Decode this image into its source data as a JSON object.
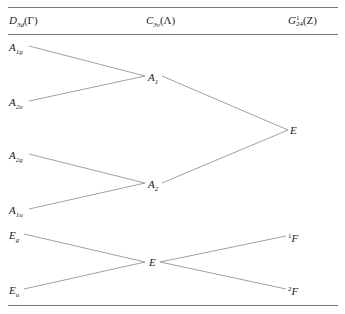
{
  "header": {
    "col1": {
      "main": "D",
      "sub": "3d",
      "paren": "(Γ)"
    },
    "col2": {
      "main": "C",
      "sub": "3v",
      "paren": "(Λ)"
    },
    "col3": {
      "main": "G",
      "sup": "1",
      "sub": "24",
      "paren": "(Z)"
    }
  },
  "left_states": [
    {
      "main": "A",
      "sub": "1g"
    },
    {
      "main": "A",
      "sub": "2u"
    },
    {
      "main": "A",
      "sub": "2g"
    },
    {
      "main": "A",
      "sub": "1u"
    },
    {
      "main": "E",
      "sub": "g"
    },
    {
      "main": "E",
      "sub": "u"
    }
  ],
  "middle_states": [
    {
      "main": "A",
      "sub": "1"
    },
    {
      "main": "A",
      "sub": "2"
    },
    {
      "main": "E",
      "sub": ""
    }
  ],
  "right_states": [
    {
      "main": "E",
      "sup": ""
    },
    {
      "main": "F",
      "sup": "1"
    },
    {
      "main": "F",
      "sup": "2"
    }
  ],
  "correlations": [
    {
      "from": "A1g",
      "to": "A1"
    },
    {
      "from": "A2u",
      "to": "A1"
    },
    {
      "from": "A2g",
      "to": "A2"
    },
    {
      "from": "A1u",
      "to": "A2"
    },
    {
      "from": "Eg",
      "to": "E"
    },
    {
      "from": "Eu",
      "to": "E"
    },
    {
      "from": "A1",
      "to": "E (Z)"
    },
    {
      "from": "A2",
      "to": "E (Z)"
    },
    {
      "from": "E",
      "to": "1F"
    },
    {
      "from": "E",
      "to": "2F"
    }
  ]
}
